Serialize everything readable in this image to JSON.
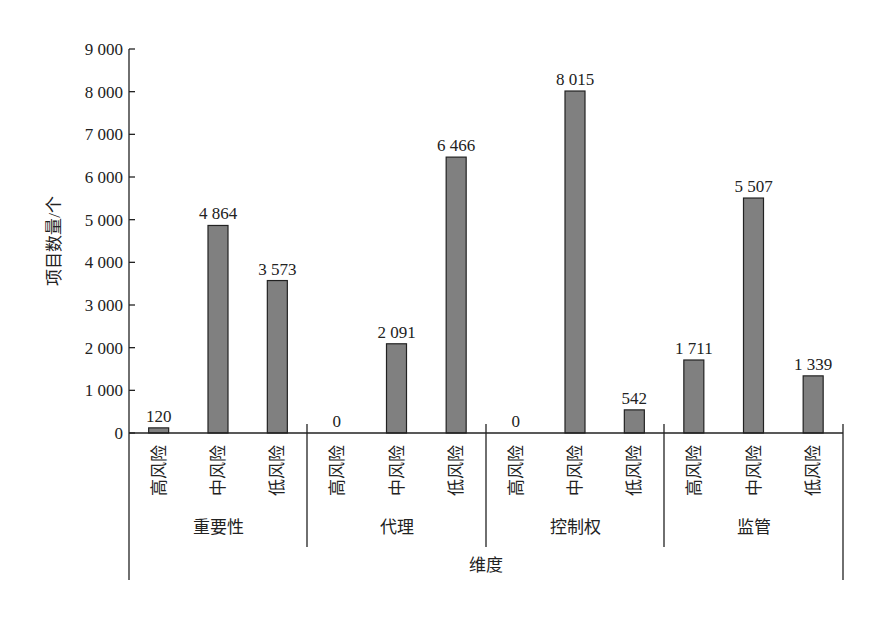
{
  "chart_data": {
    "type": "bar",
    "title": "",
    "xlabel": "维度",
    "ylabel": "项目数量/个",
    "ylim": [
      0,
      9000
    ],
    "yticks": [
      0,
      1000,
      2000,
      3000,
      4000,
      5000,
      6000,
      7000,
      8000,
      9000
    ],
    "ytick_labels": [
      "0",
      "1 000",
      "2 000",
      "3 000",
      "4 000",
      "5 000",
      "6 000",
      "7 000",
      "8 000",
      "9 000"
    ],
    "grid": false,
    "legend": null,
    "groups": [
      "重要性",
      "代理",
      "控制权",
      "监管"
    ],
    "sub_categories": [
      "高风险",
      "中风险",
      "低风险"
    ],
    "series": [
      {
        "group": "重要性",
        "values": [
          120,
          4864,
          3573
        ],
        "labels": [
          "120",
          "4 864",
          "3 573"
        ]
      },
      {
        "group": "代理",
        "values": [
          0,
          2091,
          6466
        ],
        "labels": [
          "0",
          "2 091",
          "6 466"
        ]
      },
      {
        "group": "控制权",
        "values": [
          0,
          8015,
          542
        ],
        "labels": [
          "0",
          "8 015",
          "542"
        ]
      },
      {
        "group": "监管",
        "values": [
          1711,
          5507,
          1339
        ],
        "labels": [
          "1 711",
          "5 507",
          "1 339"
        ]
      }
    ],
    "colors": {
      "bar": "#808080",
      "bar_edge": "#222222",
      "axis": "#222222"
    }
  }
}
